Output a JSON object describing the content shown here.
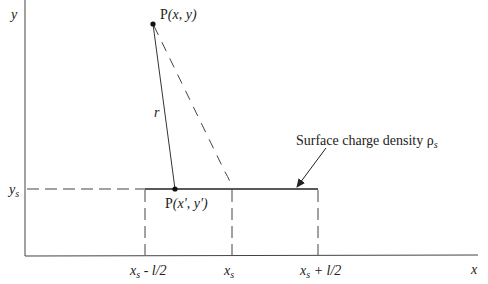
{
  "diagram": {
    "axes": {
      "x_label": "x",
      "y_label": "y",
      "ys_label": "y",
      "ys_sub": "s"
    },
    "points": {
      "field_point": {
        "prefix": "P",
        "coords": "(x, y)"
      },
      "source_point": {
        "prefix": "P",
        "coords": "(x', y')"
      }
    },
    "distance_label": "r",
    "annotation": {
      "text": "Surface charge density ρ",
      "sub": "s"
    },
    "x_ticks": [
      {
        "base": "x",
        "sub": "s",
        "suffix": " - l/2"
      },
      {
        "base": "x",
        "sub": "s",
        "suffix": ""
      },
      {
        "base": "x",
        "sub": "s",
        "suffix": " + l/2"
      }
    ],
    "colors": {
      "line": "#333333",
      "text": "#222222",
      "background": "#ffffff"
    }
  }
}
